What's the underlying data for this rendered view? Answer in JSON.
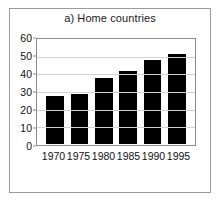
{
  "figure": {
    "title": "a) Home countries",
    "background_color": "#ffffff",
    "frame_color": "#9a9a9a",
    "axis_color": "#8c8c8c",
    "grid_color": "#d2d2d2",
    "bar_color": "#000000"
  },
  "chart_data": {
    "type": "bar",
    "title": "a) Home countries",
    "xlabel": "",
    "ylabel": "",
    "categories": [
      "1970",
      "1975",
      "1980",
      "1985",
      "1990",
      "1995"
    ],
    "values": [
      27.5,
      29,
      38,
      42,
      48.5,
      52
    ],
    "ylim": [
      0,
      60
    ],
    "yticks": [
      0,
      10,
      20,
      30,
      40,
      50,
      60
    ],
    "ytick_labels": [
      "0",
      "10",
      "20",
      "30",
      "40",
      "50",
      "60"
    ],
    "grid": "horizontal",
    "legend": "none",
    "series": [
      {
        "name": "Home countries",
        "values": [
          27.5,
          29,
          38,
          42,
          48.5,
          52
        ]
      }
    ]
  }
}
